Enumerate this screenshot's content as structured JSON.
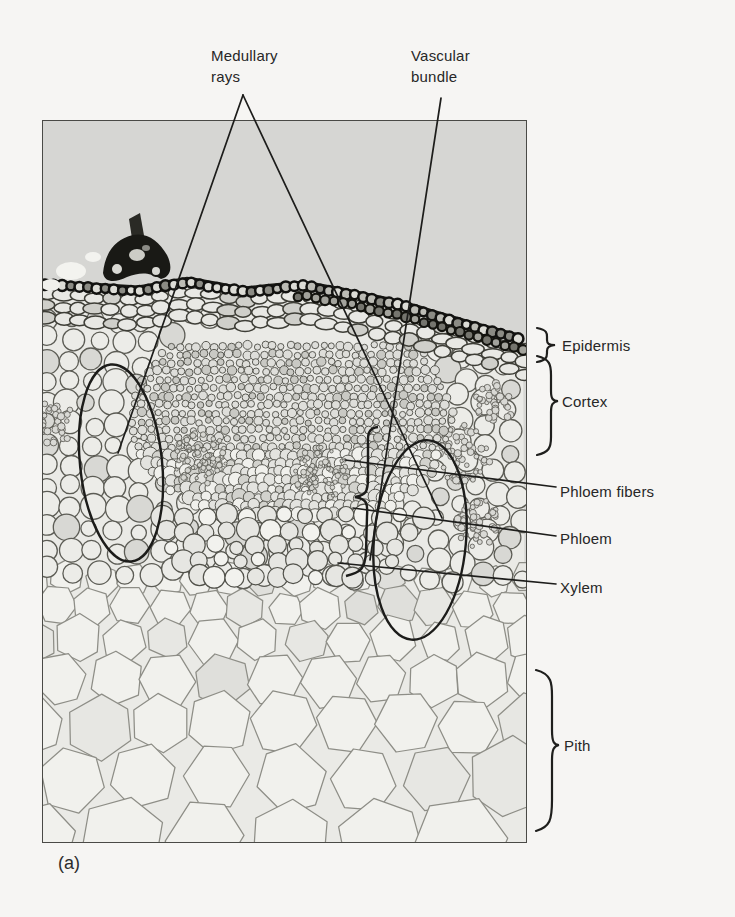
{
  "figure": {
    "panel_label": "(a)",
    "subject": "Light micrograph of a plant stem cross-section",
    "labels": {
      "medullary_rays": "Medullary\nrays",
      "vascular_bundle": "Vascular\nbundle",
      "epidermis": "Epidermis",
      "cortex": "Cortex",
      "phloem_fibers": "Phloem fibers",
      "phloem": "Phloem",
      "xylem": "Xylem",
      "pith": "Pith"
    },
    "colors": {
      "page_background": "#f6f5f3",
      "photo_background": "#d6d6d3",
      "tissue_background": "#eaeae6",
      "cell_wall": "#55554f",
      "epidermis_ink": "#171713",
      "annotation_ink": "#1d1d1b",
      "label_text": "#272727"
    }
  }
}
